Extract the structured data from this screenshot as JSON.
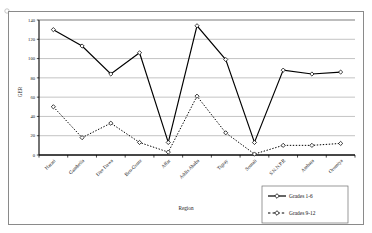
{
  "chart_data": {
    "type": "line",
    "title": "",
    "xlabel": "Region",
    "ylabel": "GER",
    "ylim": [
      0,
      140
    ],
    "ytick_step": 20,
    "yticks": [
      "0",
      "20",
      "40",
      "60",
      "80",
      "100",
      "120",
      "140"
    ],
    "grid": true,
    "legend_position": "bottom-right",
    "categories": [
      "Harari",
      "Gambella",
      "Dire Dawa",
      "Ben-Gumz",
      "Affar",
      "Addis Ababa",
      "Tigray",
      "Somali",
      "S.N.N.P.R",
      "Amhara",
      "Oromiya"
    ],
    "series": [
      {
        "name": "Grades 1-6",
        "style": "solid",
        "marker": "diamond-open",
        "color": "#000000",
        "values": [
          130,
          113,
          84,
          106,
          13,
          134,
          99,
          13,
          88,
          84,
          86
        ]
      },
      {
        "name": "Grades 9-12",
        "style": "dotted",
        "marker": "diamond-open",
        "color": "#000000",
        "values": [
          50,
          18,
          33,
          13,
          3,
          61,
          23,
          1,
          10,
          10,
          12
        ]
      }
    ]
  },
  "legend": {
    "items": [
      {
        "label": "Grades 1-6"
      },
      {
        "label": "Grades 9-12"
      }
    ]
  },
  "axes": {
    "x_title": "Region",
    "y_title": "GER"
  }
}
